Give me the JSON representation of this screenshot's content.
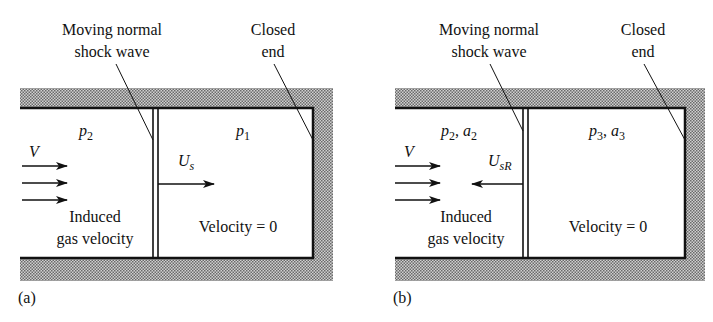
{
  "figure": {
    "panels": [
      {
        "id": "a",
        "caption": "(a)",
        "shock_label_line1": "Moving normal",
        "shock_label_line2": "shock wave",
        "end_label_line1": "Closed",
        "end_label_line2": "end",
        "left_state": "p",
        "left_state_sub": "2",
        "right_state": "p",
        "right_state_sub": "1",
        "velocity_symbol": "V",
        "shock_velocity": "U",
        "shock_velocity_sub": "s",
        "shock_direction": "right",
        "induced_line1": "Induced",
        "induced_line2": "gas velocity",
        "right_velocity": "Velocity = 0"
      },
      {
        "id": "b",
        "caption": "(b)",
        "shock_label_line1": "Moving normal",
        "shock_label_line2": "shock wave",
        "end_label_line1": "Closed",
        "end_label_line2": "end",
        "left_state": "p",
        "left_state_sub": "2",
        "left_state_b": "a",
        "left_state_b_sub": "2",
        "right_state": "p",
        "right_state_sub": "3",
        "right_state_b": "a",
        "right_state_b_sub": "3",
        "velocity_symbol": "V",
        "shock_velocity": "U",
        "shock_velocity_sub": "sR",
        "shock_direction": "left",
        "induced_line1": "Induced",
        "induced_line2": "gas velocity",
        "right_velocity": "Velocity = 0"
      }
    ],
    "colors": {
      "line": "#111111",
      "wall_shade": "#a8a8a8"
    }
  }
}
